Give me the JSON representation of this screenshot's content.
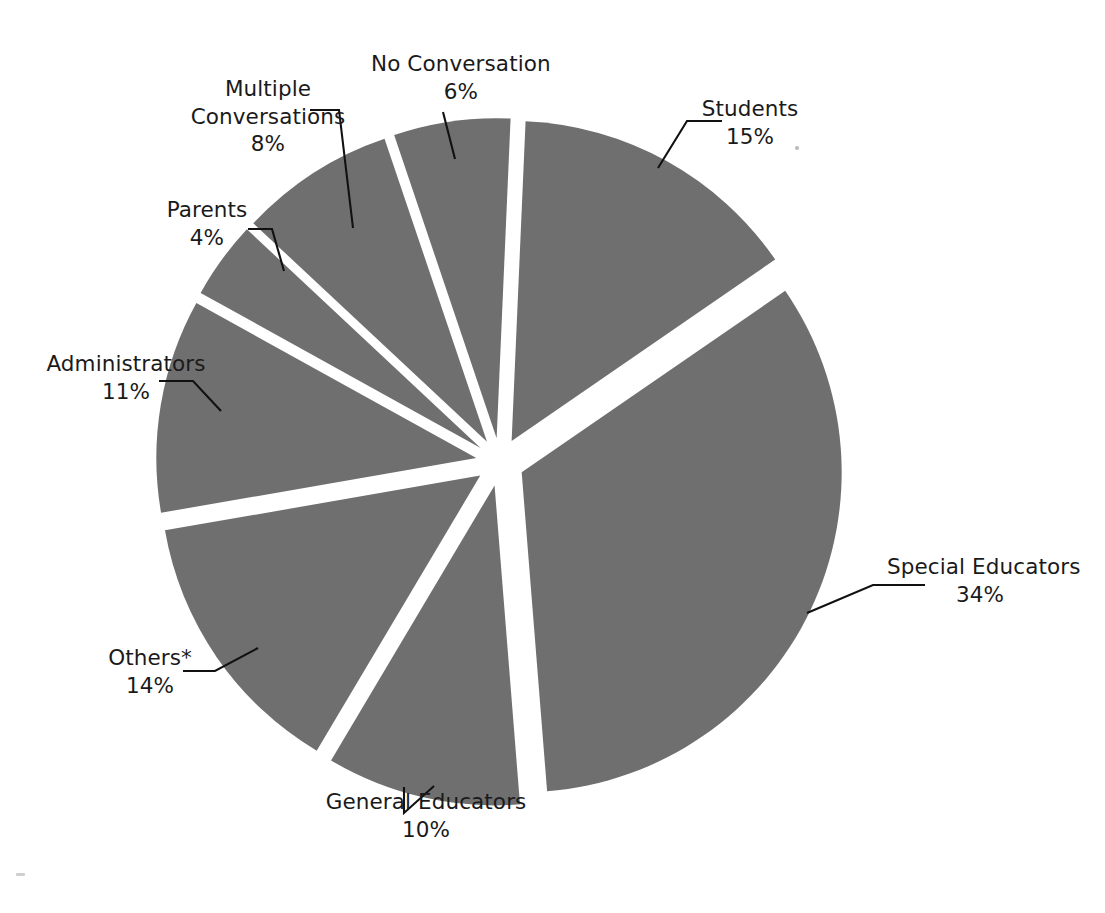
{
  "chart_data": {
    "type": "pie",
    "title": "",
    "subtitle": "",
    "exploded": true,
    "legend_position": "none",
    "grid": false,
    "units": "percent",
    "total": 102,
    "categories": [
      "Students",
      "Special Educators",
      "General Educators",
      "Others*",
      "Administrators",
      "Parents",
      "Multiple Conversations",
      "No Conversation"
    ],
    "values": [
      15,
      34,
      10,
      14,
      11,
      4,
      8,
      6
    ],
    "slices": [
      {
        "label": "Students",
        "value": 15,
        "pct_text": "15%",
        "color": "#6f6f6f"
      },
      {
        "label": "Special Educators",
        "value": 34,
        "pct_text": "34%",
        "color": "#6f6f6f"
      },
      {
        "label": "General Educators",
        "value": 10,
        "pct_text": "10%",
        "color": "#6f6f6f"
      },
      {
        "label": "Others*",
        "value": 14,
        "pct_text": "14%",
        "color": "#6f6f6f"
      },
      {
        "label": "Administrators",
        "value": 11,
        "pct_text": "11%",
        "color": "#6f6f6f"
      },
      {
        "label": "Parents",
        "value": 4,
        "pct_text": "4%",
        "color": "#6f6f6f"
      },
      {
        "label": "Multiple Conversations",
        "value": 8,
        "pct_text": "8%",
        "color": "#6f6f6f"
      },
      {
        "label": "No Conversation",
        "value": 6,
        "pct_text": "6%",
        "color": "#6f6f6f"
      }
    ],
    "colors": {
      "slice_fill": "#6f6f6f",
      "background": "#ffffff",
      "leader_line": "#111111",
      "label_text": "#1a1a1a"
    }
  },
  "labels": {
    "students": {
      "name": "Students",
      "pct": "15%"
    },
    "special": {
      "name": "Special Educators",
      "pct": "34%"
    },
    "general": {
      "name": "General Educators",
      "pct": "10%"
    },
    "others": {
      "name": "Others*",
      "pct": "14%"
    },
    "administrators": {
      "name": "Administrators",
      "pct": "11%"
    },
    "parents": {
      "name": "Parents",
      "pct": "4%"
    },
    "multiple": {
      "name": "Multiple",
      "name2": "Conversations",
      "pct": "8%"
    },
    "noconversation": {
      "name": "No Conversation",
      "pct": "6%"
    }
  }
}
